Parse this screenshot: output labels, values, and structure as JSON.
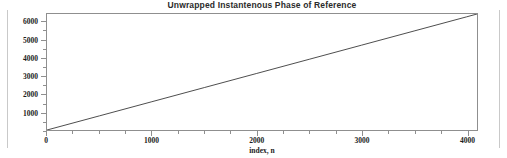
{
  "figure": {
    "background_color": "#ffffff",
    "frame_color": "#8f8f8f",
    "line_color": "#3a3a3a",
    "text_color": "#1c1c1c",
    "margin_rule_color": "#c9c9c9"
  },
  "chart_data": {
    "type": "line",
    "title": "Unwrapped Instantenous Phase of Reference",
    "xlabel": "index, n",
    "ylabel": "",
    "xlim": [
      0,
      4100
    ],
    "ylim": [
      0,
      6450
    ],
    "grid": false,
    "legend": null,
    "x_ticks": [
      0,
      1000,
      2000,
      3000,
      4000
    ],
    "x_tick_labels": [
      "0",
      "1000",
      "2000",
      "3000",
      "4000"
    ],
    "x_minor_tick_interval": 250,
    "y_ticks": [
      1000,
      2000,
      3000,
      4000,
      5000,
      6000
    ],
    "y_tick_labels": [
      "1000",
      "2000",
      "3000",
      "4000",
      "5000",
      "6000"
    ],
    "y_minor_tick_interval": 500,
    "series": [
      {
        "name": "unwrapped phase",
        "x": [
          0,
          500,
          1000,
          1500,
          2000,
          2500,
          3000,
          3500,
          4000,
          4100
        ],
        "y": [
          0,
          786,
          1573,
          2359,
          3146,
          3932,
          4718,
          5505,
          6291,
          6450
        ]
      }
    ],
    "annotations": []
  }
}
